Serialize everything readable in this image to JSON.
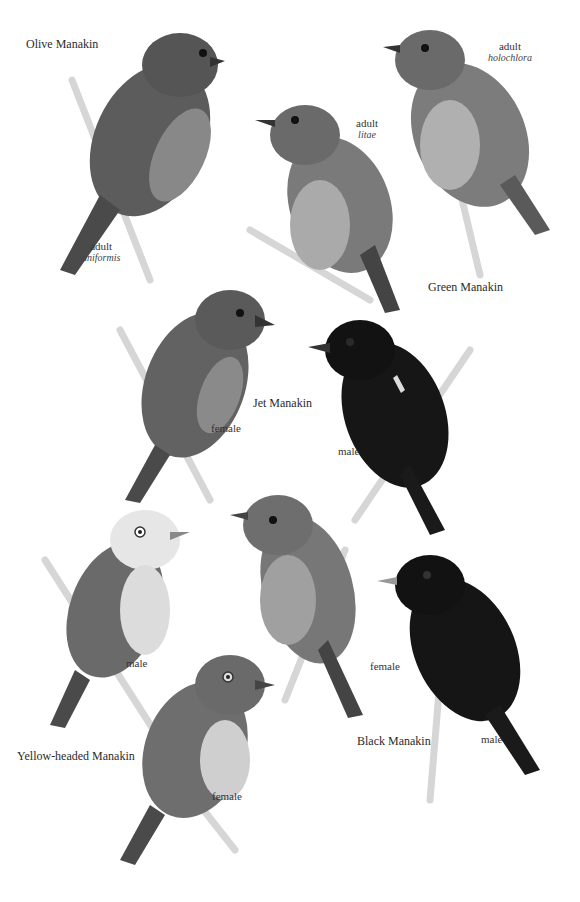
{
  "plate": {
    "species": [
      {
        "name": "Olive Manakin",
        "figures": [
          {
            "label": "adult",
            "subspecies": "uniformis"
          }
        ]
      },
      {
        "name": "Green Manakin",
        "figures": [
          {
            "label": "adult",
            "subspecies": "litae"
          },
          {
            "label": "adult",
            "subspecies": "holochlora"
          }
        ]
      },
      {
        "name": "Jet Manakin",
        "figures": [
          {
            "label": "female"
          },
          {
            "label": "male"
          }
        ]
      },
      {
        "name": "Yellow-headed Manakin",
        "figures": [
          {
            "label": "male"
          },
          {
            "label": "female"
          }
        ]
      },
      {
        "name": "Black Manakin",
        "figures": [
          {
            "label": "female"
          },
          {
            "label": "male"
          }
        ]
      }
    ]
  },
  "colors": {
    "background": "#ffffff",
    "olive_bird": "#5a5a5a",
    "green_bird": "#7a7a7a",
    "black_bird": "#141414",
    "branch": "#e4e4e4",
    "text": "#2b2b2b"
  }
}
